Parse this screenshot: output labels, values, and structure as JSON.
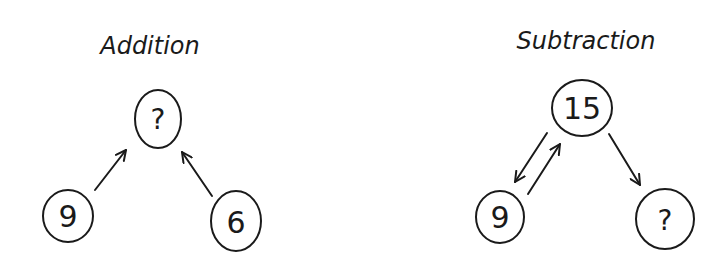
{
  "diagrams": [
    {
      "title": "Addition",
      "nodes": [
        {
          "id": "top",
          "label": "?"
        },
        {
          "id": "left",
          "label": "9"
        },
        {
          "id": "right",
          "label": "6"
        }
      ],
      "edges": [
        {
          "from": "left",
          "to": "top"
        },
        {
          "from": "right",
          "to": "top"
        }
      ]
    },
    {
      "title": "Subtraction",
      "nodes": [
        {
          "id": "top",
          "label": "15"
        },
        {
          "id": "left",
          "label": "9"
        },
        {
          "id": "right",
          "label": "?"
        }
      ],
      "edges": [
        {
          "from": "top",
          "to": "left"
        },
        {
          "from": "left",
          "to": "top"
        },
        {
          "from": "top",
          "to": "right"
        }
      ]
    }
  ],
  "colors": {
    "ink": "#1a1a1a",
    "background": "#ffffff"
  }
}
